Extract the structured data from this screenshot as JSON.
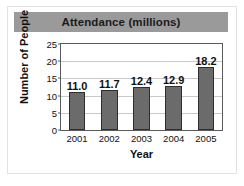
{
  "chart_data": {
    "type": "bar",
    "title": "Attendance (millions)",
    "xlabel": "Year",
    "ylabel": "Number of People",
    "categories": [
      "2001",
      "2002",
      "2003",
      "2004",
      "2005"
    ],
    "values": [
      11.0,
      11.7,
      12.4,
      12.9,
      18.2
    ],
    "value_labels": [
      "11.0",
      "11.7",
      "12.4",
      "12.9",
      "18.2"
    ],
    "ylim": [
      0,
      25
    ],
    "yticks": [
      0,
      5,
      10,
      15,
      20,
      25
    ],
    "ytick_labels": [
      "0",
      "5",
      "10",
      "15",
      "20",
      "25"
    ],
    "grid": true,
    "legend": false,
    "colors": {
      "bar_fill": "#6b6b6b",
      "bar_stroke": "#2e2e2e",
      "title_band": "#9a9a9a",
      "gridline": "#c9c9c9",
      "axis": "#5a5a5a",
      "text": "#111111",
      "background": "#ffffff"
    }
  }
}
